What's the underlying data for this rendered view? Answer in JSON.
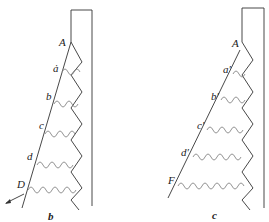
{
  "figure": {
    "panels": [
      {
        "id": "b",
        "caption": "b",
        "labels": {
          "A": "A",
          "a": "ȧ",
          "b": "b",
          "c": "c",
          "d": "d",
          "D": "D"
        }
      },
      {
        "id": "c",
        "caption": "c",
        "labels": {
          "A": "A",
          "a": "a′",
          "b": "b′",
          "c": "c′",
          "d": "d′",
          "F": "F"
        }
      }
    ]
  }
}
